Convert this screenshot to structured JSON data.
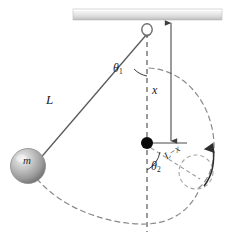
{
  "figure": {
    "background": "#ffffff",
    "width": 237,
    "height": 238
  },
  "labels": {
    "string_length": "L",
    "peg_distance": "x",
    "remaining_length": "L−x",
    "angle_upper": "θ",
    "angle_upper_sub": "1",
    "angle_lower": "θ",
    "angle_lower_sub": "2",
    "mass": "m"
  },
  "elements": {
    "ceiling_beam": {
      "name": "ceiling-beam",
      "fill_top": "#f2f2f2",
      "fill_bottom": "#c9c9c9",
      "x": 73,
      "y": 9,
      "width": 149,
      "height": 11
    },
    "pivot_ring": {
      "name": "pivot-ring",
      "cx": 147,
      "cy": 30,
      "r": 5,
      "stroke": "#6e6e6e"
    },
    "string": {
      "name": "pendulum-string",
      "from": [
        147,
        33
      ],
      "to": [
        37,
        162
      ],
      "stroke": "#5a5a5a"
    },
    "bob": {
      "name": "pendulum-bob",
      "cx": 28,
      "cy": 166,
      "r": 17,
      "fill_light": "#e8e8e8",
      "fill_dark": "#8d8d8d"
    },
    "peg": {
      "name": "peg-dot",
      "cx": 147,
      "cy": 143,
      "r": 6,
      "fill": "#000000"
    },
    "vertical_axis": {
      "name": "vertical-dashed-axis",
      "from": [
        147,
        32
      ],
      "to": [
        147,
        232
      ],
      "stroke": "#9a9a9a",
      "dash": "5,4"
    },
    "dimension_line": {
      "name": "x-dimension-line",
      "from": [
        171,
        22
      ],
      "to": [
        171,
        143
      ],
      "stroke": "#4a4a4a"
    },
    "trajectory_upper": {
      "name": "upper-dashed-trajectory",
      "stroke": "#8a8a8a",
      "dash": "5,4"
    },
    "trajectory_lower": {
      "name": "lower-dashed-trajectory",
      "stroke": "#8a8a8a",
      "dash": "5,4"
    },
    "loop_circle": {
      "name": "loop-dashed-circle",
      "cx": 196,
      "cy": 172,
      "r": 17,
      "stroke": "#a0a0a0",
      "dash": "4,3"
    },
    "motion_arrow": {
      "name": "motion-direction-arrow",
      "stroke": "#3a3a3a"
    },
    "radius_line": {
      "name": "l-minus-x-radius-line",
      "from": [
        150,
        147
      ],
      "to": [
        199,
        178
      ],
      "stroke": "#9a9a9a",
      "dash": "4,3"
    },
    "angle_arc_1": {
      "name": "theta1-arc",
      "stroke": "#3a3a3a"
    },
    "angle_arc_2": {
      "name": "theta2-arc",
      "stroke": "#3a3a3a"
    },
    "peg_tick": {
      "name": "peg-tick-line",
      "from": [
        147,
        143
      ],
      "to": [
        186,
        143
      ],
      "stroke": "#4a4a4a"
    }
  }
}
